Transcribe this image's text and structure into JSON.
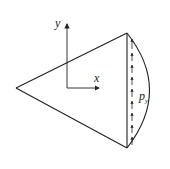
{
  "diagram": {
    "type": "circular-sector-with-edge-load",
    "colors": {
      "stroke": "#222222",
      "background": "#ffffff"
    },
    "labels": {
      "y_axis": "y",
      "x_axis": "x",
      "load_symbol": "p",
      "load_subscript": "y"
    },
    "shapes": {
      "apex": [
        16,
        88
      ],
      "chord_top": [
        127,
        33
      ],
      "chord_bottom": [
        127,
        148
      ],
      "arc_max_x": 158,
      "axis_origin": [
        67,
        88
      ],
      "y_axis_end": [
        67,
        22
      ],
      "x_axis_end": [
        100,
        88
      ]
    },
    "load_arrows": {
      "count": 9,
      "direction": "up",
      "x": 132
    }
  }
}
